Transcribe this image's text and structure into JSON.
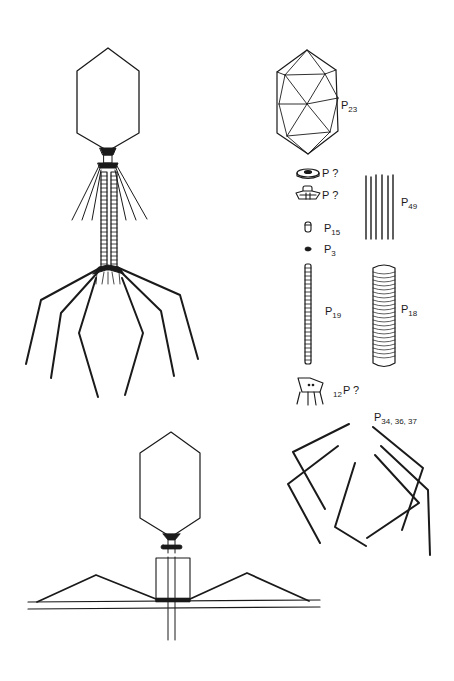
{
  "figure": {
    "colors": {
      "ink": "#1a1a1a",
      "background": "#ffffff"
    },
    "panels": {
      "intact_phage": {
        "label": ""
      },
      "components": {
        "label": ""
      },
      "contracted_phage": {
        "label": ""
      }
    },
    "labels": {
      "head": {
        "letter": "P",
        "sub": "23"
      },
      "collar_disc": {
        "letter": "P",
        "suffix": " ?"
      },
      "collar_hub": {
        "letter": "P",
        "suffix": " ?"
      },
      "whiskers": {
        "letter": "P",
        "sub": "49"
      },
      "core_plug": {
        "letter": "P",
        "sub": "15"
      },
      "core_end": {
        "letter": "P",
        "sub": "3"
      },
      "tail_core": {
        "letter": "P",
        "sub": "19"
      },
      "tail_sheath": {
        "letter": "P",
        "sub": "18"
      },
      "baseplate": {
        "prefix": "12",
        "letter": "P",
        "suffix": " ?"
      },
      "tail_fibers": {
        "letter": "P",
        "sub": "34, 36, 37"
      }
    }
  }
}
